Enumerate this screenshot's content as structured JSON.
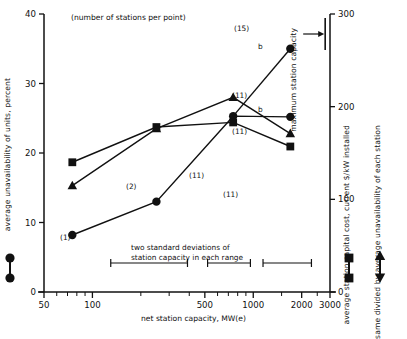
{
  "chart_data": {
    "type": "line",
    "title": "(number of stations per point)",
    "xlabel": "net station capacity, MW(e)",
    "ylabel": "average unavailability of units, percent",
    "y2label": "average station capital cost, current $/kW installed",
    "xscale": "log",
    "xlim": [
      50,
      3000
    ],
    "ylim": [
      0,
      40
    ],
    "y2lim": [
      0,
      300
    ],
    "grid": false,
    "legend_position": "outside-left-and-right",
    "xticks": [
      50,
      100,
      500,
      1000,
      2000,
      3000
    ],
    "xtick_labels": [
      "50",
      "100",
      "500",
      "1000",
      "2000",
      "3000"
    ],
    "yticks": [
      0,
      10,
      20,
      30,
      40
    ],
    "ytick_labels": [
      "0",
      "10",
      "20",
      "30",
      "40"
    ],
    "y2ticks": [
      0,
      100,
      200,
      300
    ],
    "y2tick_labels": [
      "0",
      "100",
      "200",
      "300"
    ],
    "series": [
      {
        "name": "average unavailability of units, percent",
        "marker": "circle",
        "axis": "left",
        "x": [
          75,
          250,
          750,
          1700
        ],
        "values": [
          8.2,
          13.0,
          25.3,
          25.2
        ],
        "point_labels": [
          "(1)",
          "(2)",
          "(11)",
          "(11)"
        ],
        "point_label_pos": [
          "below",
          "below",
          "",
          "above"
        ],
        "extra_points": [
          {
            "x": 1700,
            "y": 35.0,
            "label": "(15)",
            "note": "b"
          }
        ],
        "notes": [
          "b"
        ]
      },
      {
        "name": "average station capital cost, current $/kW installed",
        "marker": "square",
        "axis": "right",
        "x": [
          75,
          250,
          750,
          1700
        ],
        "values": [
          140,
          178,
          183,
          157
        ],
        "point_labels": [
          "",
          "",
          "(11)",
          "(11)"
        ],
        "point_label_pos": [
          "",
          "",
          "below",
          "below"
        ]
      },
      {
        "name": "same divided by average unavailability of each station",
        "marker": "triangle",
        "axis": "left",
        "x": [
          75,
          250,
          750,
          1700
        ],
        "values": [
          15.3,
          23.5,
          28.0,
          22.8
        ],
        "point_labels": [
          "",
          "",
          "",
          "(11)"
        ],
        "point_label_pos": [
          "",
          "",
          "",
          "below"
        ]
      }
    ],
    "annotations": [
      {
        "name": "stddev-caption-line1",
        "text": "two standard deviations of"
      },
      {
        "name": "stddev-caption-line2",
        "text": "station capacity in each range"
      },
      {
        "name": "max-capacity-label",
        "text": "maximum station capacity"
      },
      {
        "name": "point-note-b-top",
        "text": "b"
      },
      {
        "name": "point-note-b-mid",
        "text": "b"
      }
    ],
    "error_bars": [
      {
        "xmin": 130,
        "xmax": 390
      },
      {
        "xmin": 520,
        "xmax": 960
      },
      {
        "xmin": 1150,
        "xmax": 2300
      }
    ],
    "max_capacity_marker": {
      "x": 2800,
      "arrow": "right"
    }
  },
  "axes": {
    "left_label": "average unavailability of units, percent",
    "right_label_1": "average station capital cost, current $/kW installed",
    "right_label_2": "same divided by average unavailability of each station",
    "bottom_label": "net station capacity, MW(e)",
    "top_note": "(number of stations per point)",
    "max_capacity_label": "maximum station capacity"
  },
  "labels": {
    "y_ticks": [
      "40",
      "30",
      "20",
      "10",
      "0"
    ],
    "y2_ticks": [
      "300",
      "200",
      "100",
      "0"
    ],
    "x_ticks": [
      "50",
      "100",
      "500",
      "1000",
      "2000",
      "3000"
    ],
    "n1": "(1)",
    "n2": "(2)",
    "n11_a": "(11)",
    "n11_b": "(11)",
    "n11_c": "(11)",
    "n11_d": "(11)",
    "n15": "(15)",
    "b1": "b",
    "b2": "b",
    "sd_line1": "two standard deviations of",
    "sd_line2": "station capacity in each range"
  },
  "colors": {
    "ink": "#111111",
    "background": "#ffffff"
  }
}
